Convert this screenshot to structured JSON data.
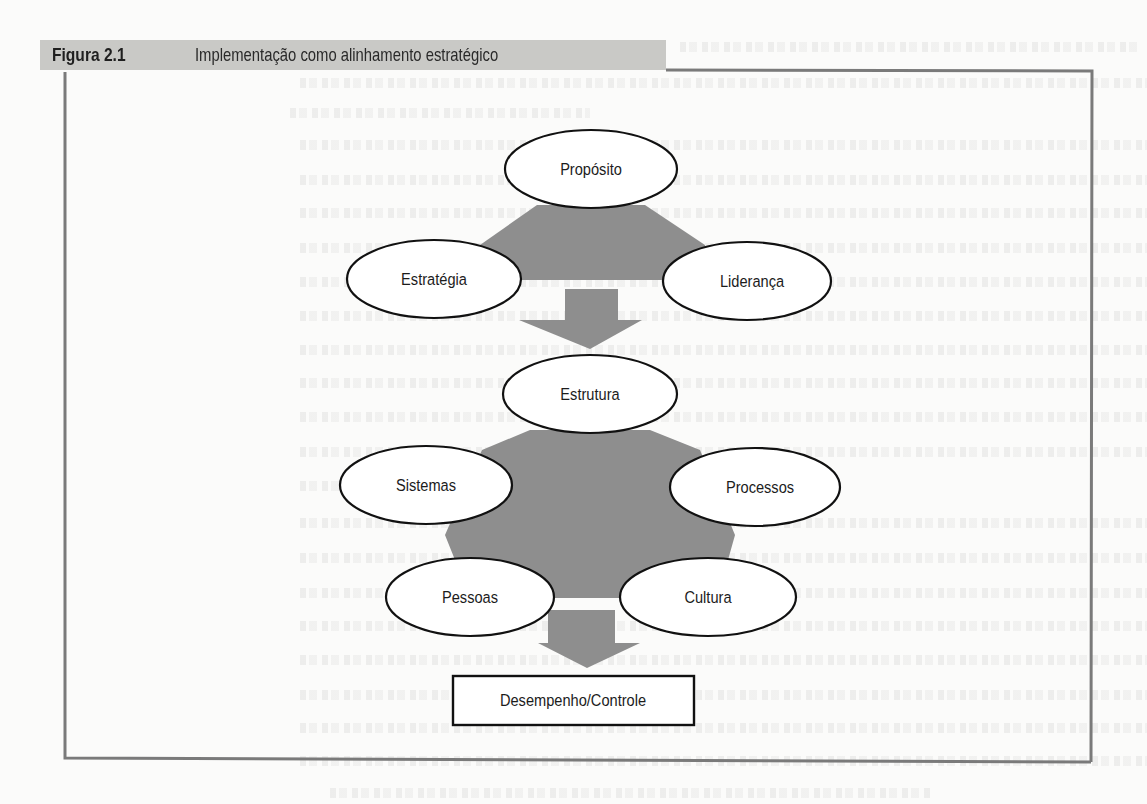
{
  "figure": {
    "number": "Figura 2.1",
    "title": "Implementação como alinhamento estratégico"
  },
  "diagram": {
    "top_group": {
      "nodes": [
        {
          "id": "proposito",
          "label": "Propósito"
        },
        {
          "id": "estrategia",
          "label": "Estratégia"
        },
        {
          "id": "lideranca",
          "label": "Liderança"
        }
      ]
    },
    "middle_group": {
      "nodes": [
        {
          "id": "estrutura",
          "label": "Estrutura"
        },
        {
          "id": "sistemas",
          "label": "Sistemas"
        },
        {
          "id": "processos",
          "label": "Processos"
        },
        {
          "id": "pessoas",
          "label": "Pessoas"
        },
        {
          "id": "cultura",
          "label": "Cultura"
        }
      ]
    },
    "outcome": {
      "id": "desempenho-controle",
      "label": "Desempenho/Controle"
    },
    "flow": [
      {
        "from": "top_group",
        "to": "middle_group",
        "direction": "down"
      },
      {
        "from": "middle_group",
        "to": "outcome",
        "direction": "down"
      }
    ],
    "colors": {
      "shape_fill": "#8e8e8e",
      "node_fill": "#ffffff",
      "node_stroke": "#111111",
      "title_bar": "#c9c9c6",
      "frame": "#7a7a7a"
    }
  }
}
